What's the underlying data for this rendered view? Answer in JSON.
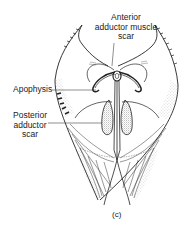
{
  "figure": {
    "caption": "(c)",
    "labels": {
      "anterior_adductor": [
        "Anterior",
        "adductor muscle",
        "scar"
      ],
      "apophysis": "Apophysis",
      "posterior_adductor": [
        "Posterior",
        "adductor",
        "scar"
      ]
    }
  },
  "colors": {
    "ink": "#222222",
    "stipple": "#555555",
    "background": "#ffffff"
  }
}
